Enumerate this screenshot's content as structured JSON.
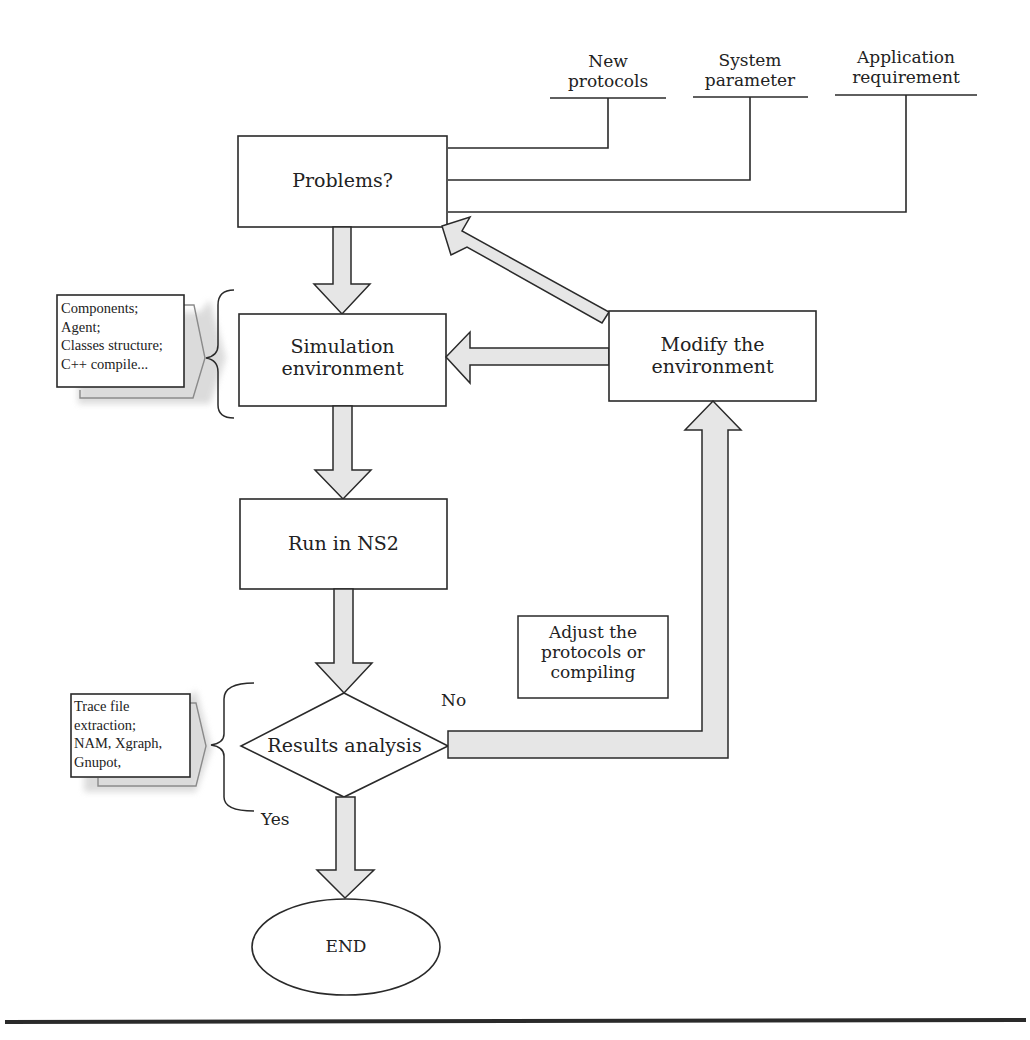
{
  "diagram": {
    "type": "flowchart",
    "inputs": [
      {
        "id": "new_protocols",
        "label": "New\nprotocols",
        "line1": "New",
        "line2": "protocols"
      },
      {
        "id": "system_parameter",
        "label": "System\nparameter",
        "line1": "System",
        "line2": "parameter"
      },
      {
        "id": "application_requirement",
        "label": "Application\nrequirement",
        "line1": "Application",
        "line2": "requirement"
      }
    ],
    "nodes": {
      "problems": {
        "label": "Problems?",
        "shape": "rectangle"
      },
      "simulation": {
        "label": "Simulation environment",
        "line1": "Simulation",
        "line2": "environment",
        "shape": "rectangle"
      },
      "modify": {
        "label": "Modify the environment",
        "line1": "Modify the",
        "line2": "environment",
        "shape": "rectangle"
      },
      "run": {
        "label": "Run in NS2",
        "shape": "rectangle"
      },
      "results": {
        "label": "Results analysis",
        "shape": "diamond"
      },
      "end": {
        "label": "END",
        "shape": "ellipse"
      },
      "adjust": {
        "label": "Adjust the protocols or compiling",
        "line1": "Adjust the",
        "line2": "protocols or",
        "line3": "compiling",
        "shape": "rectangle"
      }
    },
    "notes": {
      "simulation_details": {
        "lines": [
          "Components;",
          "Agent;",
          "Classes structure;",
          "C++ compile..."
        ]
      },
      "analysis_tools": {
        "lines": [
          "Trace file",
          "extraction;",
          "NAM, Xgraph,",
          "Gnupot,"
        ]
      }
    },
    "edge_labels": {
      "no": "No",
      "yes": "Yes"
    },
    "edges": [
      {
        "from": "new_protocols",
        "to": "problems"
      },
      {
        "from": "system_parameter",
        "to": "problems"
      },
      {
        "from": "application_requirement",
        "to": "problems"
      },
      {
        "from": "problems",
        "to": "simulation"
      },
      {
        "from": "simulation",
        "to": "run"
      },
      {
        "from": "run",
        "to": "results"
      },
      {
        "from": "results",
        "to": "end",
        "label": "Yes"
      },
      {
        "from": "results",
        "to": "modify",
        "label": "No"
      },
      {
        "from": "modify",
        "to": "simulation"
      },
      {
        "from": "modify",
        "to": "problems"
      }
    ],
    "colors": {
      "arrow_fill": "#e6e6e6",
      "stroke": "#2a2a2a",
      "shadow": "#d9d9d9"
    }
  }
}
